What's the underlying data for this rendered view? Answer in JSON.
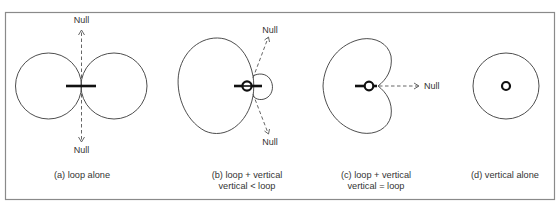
{
  "figure": {
    "panels": [
      {
        "id": "a",
        "caption_lines": [
          "(a) loop alone"
        ],
        "pattern": "figure-eight",
        "null_labels": [
          "Null",
          "Null"
        ],
        "elements": [
          "loop"
        ]
      },
      {
        "id": "b",
        "caption_lines": [
          "(b) loop + vertical",
          "vertical < loop"
        ],
        "pattern": "limacon",
        "null_labels": [
          "Null",
          "Null"
        ],
        "elements": [
          "loop",
          "vertical"
        ]
      },
      {
        "id": "c",
        "caption_lines": [
          "(c) loop + vertical",
          "vertical = loop"
        ],
        "pattern": "cardioid",
        "null_labels": [
          "Null"
        ],
        "elements": [
          "loop",
          "vertical"
        ]
      },
      {
        "id": "d",
        "caption_lines": [
          "(d) vertical alone"
        ],
        "pattern": "omnidirectional",
        "null_labels": [],
        "elements": [
          "vertical"
        ]
      }
    ]
  },
  "colors": {
    "frame": "#8a8a8a",
    "pattern_stroke": "#3a3a3a",
    "antenna": "#111111",
    "null_arrow": "#555555",
    "text": "#333333",
    "background": "#ffffff"
  }
}
